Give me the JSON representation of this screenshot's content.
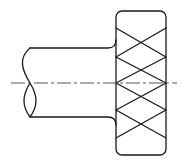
{
  "diagram": {
    "title": "",
    "type": "technical-drawing",
    "colors": {
      "stroke": "#1a1a1a",
      "centerline": "#555555",
      "background": "#ffffff"
    }
  }
}
